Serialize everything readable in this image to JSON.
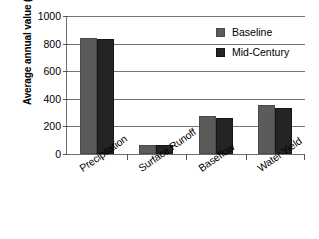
{
  "chart_data": {
    "type": "bar",
    "title": "",
    "xlabel": "",
    "ylabel": "Average annual value (mm)",
    "ylim": [
      0,
      1000
    ],
    "ytick_labels": [
      "0",
      "200",
      "400",
      "600",
      "800",
      "1000"
    ],
    "ytick_values": [
      0,
      200,
      400,
      600,
      800,
      1000
    ],
    "grid": "horizontal",
    "legend_position": "top-right",
    "categories": [
      "Precipitation",
      "Surface Runoff",
      "Baseflow",
      "Water Yield"
    ],
    "series": [
      {
        "name": "Baseline",
        "color": "#5b5b5b",
        "values": [
          843,
          68,
          277,
          353
        ]
      },
      {
        "name": "Mid-Century",
        "color": "#242424",
        "values": [
          830,
          65,
          259,
          336
        ]
      }
    ]
  },
  "legend": {
    "items": [
      {
        "label": "Baseline",
        "swatch": "baseline-swatch"
      },
      {
        "label": "Mid-Century",
        "swatch": "mid-century-swatch"
      }
    ]
  }
}
